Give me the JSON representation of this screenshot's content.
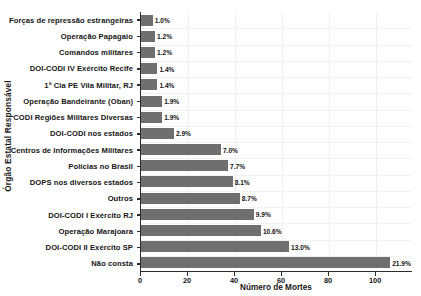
{
  "chart": {
    "type": "bar",
    "orientation": "horizontal",
    "xlabel": "Número de Mortes",
    "ylabel": "Órgão Estatal Responsável",
    "title": "",
    "bar_color": "#6f6f6f",
    "grid": true,
    "legend": "none",
    "xlim": [
      0,
      115.7
    ],
    "xticks": [
      0,
      20,
      40,
      60,
      80,
      100
    ],
    "xtick_labels": [
      "0",
      "20",
      "40",
      "60",
      "80",
      "100"
    ]
  },
  "chart_data": {
    "type": "bar",
    "title": "",
    "xlabel": "Número de Mortes",
    "ylabel": "Órgão Estatal Responsável",
    "orientation": "horizontal",
    "xlim": [
      0,
      115.7
    ],
    "grid": true,
    "legend": "none",
    "categories": [
      "Forças de repressão estrangeiras",
      "Operação Papagaio",
      "Comandos militares",
      "DOI-CODI IV Exército Recife",
      "1ª Cia PE Vila Militar, RJ",
      "Operação Bandeirante (Oban)",
      "CODI Regiões Militares Diversas",
      "DOI-CODI nos estados",
      "Centros de Informações Militares",
      "Polícias no Brasil",
      "DOPS nos diversos estados",
      "Outros",
      "DOI-CODI I Exército RJ",
      "Operação Marajoara",
      "DOI-CODI II Exército SP",
      "Não consta"
    ],
    "values": [
      5,
      6,
      6,
      7,
      7,
      9,
      9,
      14,
      34,
      37,
      39,
      42,
      48,
      51,
      63,
      106
    ],
    "data_labels": [
      "1.0%",
      "1.2%",
      "1.2%",
      "1.4%",
      "1.4%",
      "1.9%",
      "1.9%",
      "2.9%",
      "7.0%",
      "7.7%",
      "8.1%",
      "8.7%",
      "9.9%",
      "10.6%",
      "13.0%",
      "21.9%"
    ],
    "percentages": [
      1.0,
      1.2,
      1.2,
      1.4,
      1.4,
      1.9,
      1.9,
      2.9,
      7.0,
      7.7,
      8.1,
      8.7,
      9.9,
      10.6,
      13.0,
      21.9
    ]
  }
}
